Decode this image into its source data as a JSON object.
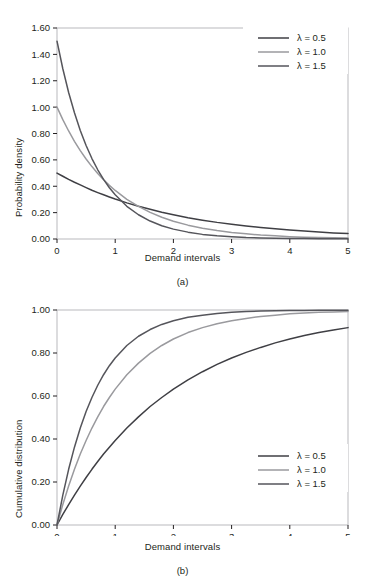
{
  "figure": {
    "faint_header": "  ",
    "background_color": "#ffffff",
    "ink_color": "#231f20"
  },
  "chart_data": [
    {
      "id": "panel-a",
      "type": "line",
      "title": "",
      "caption": "(a)",
      "xlabel": "Demand intervals",
      "ylabel": "Probability density",
      "xlim": [
        0,
        5
      ],
      "ylim": [
        0.0,
        1.6
      ],
      "xticks": [
        "0",
        "1",
        "2",
        "3",
        "4",
        "5"
      ],
      "xtick_values": [
        0,
        1,
        2,
        3,
        4,
        5
      ],
      "yticks": [
        "0.00",
        "0.20",
        "0.40",
        "0.60",
        "0.80",
        "1.00",
        "1.20",
        "1.40",
        "1.60"
      ],
      "ytick_values": [
        0.0,
        0.2,
        0.4,
        0.6,
        0.8,
        1.0,
        1.2,
        1.4,
        1.6
      ],
      "grid": false,
      "legend_position": "top-right",
      "x": [
        0,
        0.1,
        0.2,
        0.3,
        0.4,
        0.5,
        0.6,
        0.7,
        0.8,
        0.9,
        1.0,
        1.2,
        1.4,
        1.6,
        1.8,
        2.0,
        2.25,
        2.5,
        2.75,
        3.0,
        3.25,
        3.5,
        3.75,
        4.0,
        4.25,
        4.5,
        4.75,
        5.0
      ],
      "series": [
        {
          "name": "λ = 0.5",
          "lambda": 0.5,
          "color": "#3f3f44",
          "width": 1.5,
          "values": [
            0.5,
            0.476,
            0.452,
            0.43,
            0.41,
            0.39,
            0.37,
            0.352,
            0.335,
            0.319,
            0.303,
            0.274,
            0.248,
            0.225,
            0.203,
            0.184,
            0.162,
            0.143,
            0.126,
            0.112,
            0.099,
            0.087,
            0.077,
            0.068,
            0.06,
            0.053,
            0.046,
            0.041
          ]
        },
        {
          "name": "λ = 1.0",
          "lambda": 1.0,
          "color": "#9a9a9e",
          "width": 1.5,
          "values": [
            1.0,
            0.905,
            0.819,
            0.741,
            0.67,
            0.607,
            0.549,
            0.497,
            0.449,
            0.407,
            0.368,
            0.301,
            0.247,
            0.202,
            0.165,
            0.135,
            0.105,
            0.082,
            0.064,
            0.05,
            0.039,
            0.03,
            0.024,
            0.018,
            0.014,
            0.011,
            0.009,
            0.007
          ]
        },
        {
          "name": "λ = 1.5",
          "lambda": 1.5,
          "color": "#55555b",
          "width": 1.5,
          "values": [
            1.5,
            1.291,
            1.111,
            0.957,
            0.823,
            0.709,
            0.61,
            0.525,
            0.452,
            0.389,
            0.335,
            0.248,
            0.184,
            0.136,
            0.101,
            0.075,
            0.052,
            0.035,
            0.024,
            0.017,
            0.011,
            0.008,
            0.005,
            0.004,
            0.003,
            0.002,
            0.001,
            0.001
          ]
        }
      ]
    },
    {
      "id": "panel-b",
      "type": "line",
      "title": "",
      "caption": "(b)",
      "xlabel": "Demand intervals",
      "ylabel": "Cumulative distribution",
      "xlim": [
        0,
        5
      ],
      "ylim": [
        0.0,
        1.0
      ],
      "xticks": [
        "0",
        "1",
        "2",
        "3",
        "4",
        "5"
      ],
      "xtick_values": [
        0,
        1,
        2,
        3,
        4,
        5
      ],
      "yticks": [
        "0.00",
        "0.20",
        "0.40",
        "0.60",
        "0.80",
        "1.00"
      ],
      "ytick_values": [
        0.0,
        0.2,
        0.4,
        0.6,
        0.8,
        1.0
      ],
      "grid": false,
      "legend_position": "bottom-right",
      "x": [
        0,
        0.1,
        0.2,
        0.3,
        0.4,
        0.5,
        0.6,
        0.7,
        0.8,
        0.9,
        1.0,
        1.2,
        1.4,
        1.6,
        1.8,
        2.0,
        2.25,
        2.5,
        2.75,
        3.0,
        3.25,
        3.5,
        3.75,
        4.0,
        4.25,
        4.5,
        4.75,
        5.0
      ],
      "series": [
        {
          "name": "λ = 0.5",
          "lambda": 0.5,
          "color": "#3f3f44",
          "width": 1.5,
          "values": [
            0.0,
            0.049,
            0.095,
            0.139,
            0.181,
            0.221,
            0.259,
            0.295,
            0.33,
            0.362,
            0.393,
            0.451,
            0.503,
            0.551,
            0.593,
            0.632,
            0.675,
            0.713,
            0.747,
            0.777,
            0.803,
            0.826,
            0.847,
            0.865,
            0.881,
            0.895,
            0.907,
            0.918
          ]
        },
        {
          "name": "λ = 1.0",
          "lambda": 1.0,
          "color": "#9a9a9e",
          "width": 1.5,
          "values": [
            0.0,
            0.095,
            0.181,
            0.259,
            0.33,
            0.393,
            0.451,
            0.503,
            0.551,
            0.593,
            0.632,
            0.699,
            0.753,
            0.798,
            0.835,
            0.865,
            0.895,
            0.918,
            0.936,
            0.95,
            0.961,
            0.97,
            0.976,
            0.982,
            0.986,
            0.989,
            0.991,
            0.993
          ]
        },
        {
          "name": "λ = 1.5",
          "lambda": 1.5,
          "color": "#55555b",
          "width": 1.5,
          "values": [
            0.0,
            0.139,
            0.259,
            0.362,
            0.451,
            0.528,
            0.593,
            0.65,
            0.699,
            0.741,
            0.777,
            0.835,
            0.878,
            0.909,
            0.933,
            0.95,
            0.966,
            0.976,
            0.984,
            0.989,
            0.993,
            0.995,
            0.996,
            0.998,
            0.998,
            0.999,
            0.999,
            0.999
          ]
        }
      ]
    }
  ]
}
